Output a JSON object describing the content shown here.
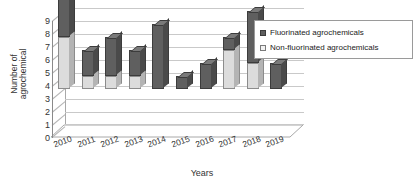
{
  "chart_data": {
    "type": "bar",
    "title": "",
    "subtitle": "",
    "xlabel": "Years",
    "ylabel": "Number of agrochemical",
    "ylabel_lines": [
      "Number of",
      "agrochemical"
    ],
    "categories": [
      "2010",
      "2011",
      "2012",
      "2013",
      "2014",
      "2015",
      "2016",
      "2017",
      "2018",
      "2019"
    ],
    "series": [
      {
        "name": "Non-fluorinated agrochemicals",
        "color": "#dcdcdc",
        "values": [
          4,
          1,
          1,
          1,
          0,
          0,
          0,
          3,
          2,
          0
        ]
      },
      {
        "name": "Fluorinated agrochemicals",
        "color": "#5f5f5f",
        "values": [
          5,
          2,
          3,
          2,
          5,
          1,
          2,
          1,
          4,
          2
        ]
      }
    ],
    "totals": [
      9,
      3,
      4,
      3,
      5,
      1,
      2,
      4,
      6,
      2
    ],
    "stacked": true,
    "ylim": [
      0,
      9
    ],
    "yticks": [
      "0",
      "1",
      "2",
      "3",
      "4",
      "5",
      "6",
      "7",
      "8",
      "9"
    ],
    "grid": true,
    "grid_axis": "y",
    "three_d": true,
    "legend_position": "right-top"
  },
  "legend": {
    "entries": [
      {
        "label": "Fluorinated agrochemicals",
        "swatch": "dark"
      },
      {
        "label": "Non-fluorinated agrochemicals",
        "swatch": "light"
      }
    ]
  },
  "colors": {
    "fluorinated": "#5f5f5f",
    "non_fluorinated": "#dcdcdc",
    "gridline": "#c9c9c9",
    "axis": "#8a8a8a",
    "background": "#ffffff",
    "text": "#333333"
  }
}
